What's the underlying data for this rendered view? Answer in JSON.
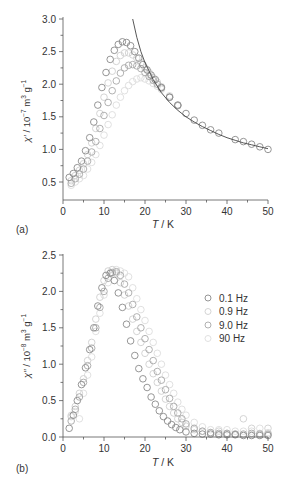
{
  "chart_data": [
    {
      "panel": "(a)",
      "type": "scatter",
      "title": "",
      "xlabel": "T / K",
      "ylabel": "χ' / 10⁻⁷ m³ g⁻¹",
      "xlim": [
        0,
        50
      ],
      "ylim": [
        0.25,
        3.0
      ],
      "xticks": [
        0,
        10,
        20,
        30,
        40,
        50
      ],
      "yticks": [
        0.5,
        1.0,
        1.5,
        2.0,
        2.5,
        3.0
      ],
      "grid": false,
      "fit_curve": {
        "description": "Curie-Weiss fit (solid line)",
        "x": [
          17,
          18,
          19,
          20,
          22,
          24,
          26,
          28,
          30,
          32,
          34,
          36,
          38,
          40,
          42,
          44,
          46,
          48,
          50
        ],
        "y": [
          3.0,
          2.72,
          2.5,
          2.33,
          2.07,
          1.87,
          1.72,
          1.6,
          1.5,
          1.42,
          1.35,
          1.29,
          1.23,
          1.18,
          1.14,
          1.1,
          1.07,
          1.04,
          1.01
        ]
      },
      "series": [
        {
          "name": "0.1 Hz",
          "color": "#8a8a8a",
          "x": [
            1.5,
            2.5,
            3.5,
            4.5,
            5.5,
            6.5,
            7.5,
            8.5,
            9.5,
            10.5,
            11.5,
            12.5,
            13.5,
            14.5,
            15.5,
            16.5,
            17.5,
            18.5,
            19.5,
            20.5,
            21.5,
            22.5,
            24,
            26,
            28,
            30,
            32,
            34,
            36,
            38,
            42,
            44,
            46,
            48,
            50
          ],
          "y": [
            0.57,
            0.63,
            0.72,
            0.82,
            0.98,
            1.18,
            1.42,
            1.68,
            1.95,
            2.18,
            2.38,
            2.52,
            2.61,
            2.65,
            2.64,
            2.59,
            2.5,
            2.4,
            2.3,
            2.22,
            2.14,
            2.07,
            1.95,
            1.8,
            1.68,
            1.55,
            1.45,
            1.37,
            1.3,
            1.25,
            1.15,
            1.12,
            1.08,
            1.04,
            1.0
          ]
        },
        {
          "name": "0.9 Hz",
          "color": "#cfcfcf",
          "x": [
            2,
            3,
            4,
            5,
            6,
            7,
            8,
            9,
            10,
            11,
            12,
            13,
            14,
            15,
            16,
            17,
            18,
            19,
            20,
            21,
            22,
            23,
            24,
            26,
            28
          ],
          "y": [
            0.52,
            0.6,
            0.68,
            0.78,
            0.92,
            1.1,
            1.32,
            1.55,
            1.8,
            2.02,
            2.2,
            2.35,
            2.44,
            2.48,
            2.48,
            2.45,
            2.4,
            2.33,
            2.25,
            2.18,
            2.1,
            2.03,
            1.96,
            1.82,
            1.68
          ]
        },
        {
          "name": "9.0 Hz",
          "color": "#a8a8a8",
          "x": [
            2,
            3,
            4,
            5,
            6,
            7,
            8,
            9,
            10,
            11,
            12,
            13,
            14,
            15,
            16,
            17,
            18,
            19,
            20,
            21,
            22,
            23,
            24,
            26,
            28
          ],
          "y": [
            0.48,
            0.55,
            0.62,
            0.7,
            0.82,
            0.96,
            1.12,
            1.32,
            1.52,
            1.72,
            1.9,
            2.05,
            2.17,
            2.25,
            2.29,
            2.3,
            2.28,
            2.24,
            2.18,
            2.12,
            2.06,
            2.0,
            1.94,
            1.8,
            1.67
          ]
        },
        {
          "name": "90 Hz",
          "color": "#dcdcdc",
          "x": [
            2,
            3,
            4,
            5,
            6,
            7,
            8,
            9,
            10,
            11,
            12,
            13,
            14,
            15,
            16,
            17,
            18,
            19,
            20,
            21,
            22,
            23,
            24,
            26,
            28
          ],
          "y": [
            0.45,
            0.5,
            0.55,
            0.6,
            0.7,
            0.8,
            0.92,
            1.06,
            1.22,
            1.38,
            1.53,
            1.68,
            1.8,
            1.9,
            1.98,
            2.04,
            2.08,
            2.1,
            2.08,
            2.05,
            2.01,
            1.97,
            1.92,
            1.8,
            1.67
          ]
        }
      ]
    },
    {
      "panel": "(b)",
      "type": "scatter",
      "title": "",
      "xlabel": "T / K",
      "ylabel": "χ'' / 10⁻⁸ m³ g⁻¹",
      "xlim": [
        0,
        50
      ],
      "ylim": [
        0.0,
        2.5
      ],
      "xticks": [
        0,
        10,
        20,
        30,
        40,
        50
      ],
      "yticks": [
        0.0,
        0.5,
        1.0,
        1.5,
        2.0,
        2.5
      ],
      "grid": false,
      "legend_position": "upper right",
      "series": [
        {
          "name": "0.1 Hz",
          "color": "#8a8a8a",
          "x": [
            1.5,
            2.5,
            3.5,
            4.5,
            5.5,
            6.5,
            7.5,
            8.5,
            9.5,
            10.5,
            11.5,
            12.5,
            13.5,
            14.5,
            15.5,
            16.5,
            17.5,
            18.5,
            19.5,
            20.5,
            21.5,
            22.5,
            23.5,
            24.5,
            25.5,
            26.5,
            27.5,
            28.5,
            30,
            32,
            34,
            36,
            38,
            40,
            42,
            44,
            46,
            48,
            50
          ],
          "y": [
            0.12,
            0.3,
            0.5,
            0.72,
            0.95,
            1.2,
            1.5,
            1.8,
            2.05,
            2.22,
            2.25,
            2.15,
            1.98,
            1.78,
            1.55,
            1.32,
            1.12,
            0.94,
            0.8,
            0.68,
            0.55,
            0.45,
            0.36,
            0.28,
            0.22,
            0.17,
            0.13,
            0.1,
            0.07,
            0.05,
            0.04,
            0.04,
            0.03,
            0.03,
            0.03,
            0.02,
            0.02,
            0.02,
            0.02
          ]
        },
        {
          "name": "0.9 Hz",
          "color": "#cfcfcf",
          "x": [
            2,
            3,
            4,
            5,
            6,
            7,
            8,
            9,
            10,
            11,
            12,
            13,
            14,
            15,
            16,
            17,
            18,
            19,
            20,
            21,
            22,
            23,
            24,
            25,
            26,
            27,
            28,
            29,
            30,
            32,
            34,
            36,
            38,
            40,
            42,
            44,
            46,
            48,
            50
          ],
          "y": [
            0.28,
            0.42,
            0.6,
            0.8,
            1.05,
            1.3,
            1.62,
            1.92,
            2.15,
            2.28,
            2.3,
            2.25,
            2.12,
            1.95,
            1.8,
            1.62,
            1.45,
            1.3,
            1.15,
            1.0,
            0.87,
            0.75,
            0.63,
            0.52,
            0.42,
            0.33,
            0.25,
            0.2,
            0.15,
            0.1,
            0.08,
            0.06,
            0.08,
            0.05,
            0.04,
            0.25,
            0.12,
            0.05,
            0.12
          ]
        },
        {
          "name": "9.0 Hz",
          "color": "#a8a8a8",
          "x": [
            2,
            3,
            4,
            5,
            6,
            7,
            8,
            9,
            10,
            11,
            12,
            13,
            14,
            15,
            16,
            17,
            18,
            19,
            20,
            21,
            22,
            23,
            24,
            25,
            26,
            27,
            28,
            29,
            30,
            32,
            34,
            36,
            38,
            40,
            42,
            44,
            46,
            48,
            50
          ],
          "y": [
            0.22,
            0.38,
            0.55,
            0.75,
            0.98,
            1.22,
            1.5,
            1.78,
            2.0,
            2.18,
            2.26,
            2.27,
            2.22,
            2.1,
            1.98,
            1.82,
            1.65,
            1.5,
            1.35,
            1.2,
            1.05,
            0.9,
            0.78,
            0.65,
            0.53,
            0.42,
            0.33,
            0.25,
            0.18,
            0.12,
            0.08,
            0.06,
            0.05,
            0.05,
            0.04,
            0.04,
            0.05,
            0.04,
            0.04
          ]
        },
        {
          "name": "90 Hz",
          "color": "#dcdcdc",
          "x": [
            2,
            3,
            4,
            5,
            6,
            7,
            8,
            9,
            10,
            11,
            12,
            13,
            14,
            15,
            16,
            17,
            18,
            19,
            20,
            21,
            22,
            23,
            24,
            25,
            26,
            27,
            28,
            29,
            30,
            32,
            34,
            36,
            38,
            40,
            42,
            44,
            46,
            48,
            50
          ],
          "y": [
            0.3,
            0.35,
            0.25,
            0.6,
            0.85,
            1.1,
            1.45,
            1.7,
            1.95,
            2.12,
            2.25,
            2.3,
            2.28,
            2.25,
            2.2,
            2.05,
            1.9,
            1.75,
            1.6,
            1.45,
            1.3,
            1.15,
            1.0,
            0.85,
            0.72,
            0.6,
            0.48,
            0.38,
            0.3,
            0.2,
            0.14,
            0.1,
            0.1,
            0.1,
            0.08,
            0.08,
            0.08,
            0.12,
            0.06
          ]
        }
      ]
    }
  ],
  "panels": {
    "a": {
      "label": "(a)",
      "xlabel": "T / K",
      "ylabel_main": "χ′ / 10",
      "ylabel_exp": "−7",
      "ylabel_unit": " m",
      "ylabel_unit_exp": "3",
      "ylabel_g": " g",
      "ylabel_g_exp": "−1",
      "yticklabels": [
        "3.0",
        "2.5",
        "2.0",
        "1.5",
        "1.0",
        "0.5"
      ],
      "xticklabels": [
        "0",
        "10",
        "20",
        "30",
        "40",
        "50"
      ]
    },
    "b": {
      "label": "(b)",
      "xlabel": "T / K",
      "ylabel_main": "χ″ / 10",
      "ylabel_exp": "−8",
      "ylabel_unit": " m",
      "ylabel_unit_exp": "3",
      "ylabel_g": " g",
      "ylabel_g_exp": "−1",
      "yticklabels": [
        "2.5",
        "2.0",
        "1.5",
        "1.0",
        "0.5",
        "0.0"
      ],
      "xticklabels": [
        "0",
        "10",
        "20",
        "30",
        "40",
        "50"
      ]
    }
  },
  "legend": {
    "items": [
      {
        "label": "0.1 Hz",
        "color": "#8a8a8a"
      },
      {
        "label": "0.9 Hz",
        "color": "#cfcfcf"
      },
      {
        "label": "9.0 Hz",
        "color": "#a8a8a8"
      },
      {
        "label": "90 Hz",
        "color": "#dcdcdc"
      }
    ]
  },
  "colors": {
    "axis": "#555555",
    "text": "#333333",
    "fit_line": "#444444"
  }
}
